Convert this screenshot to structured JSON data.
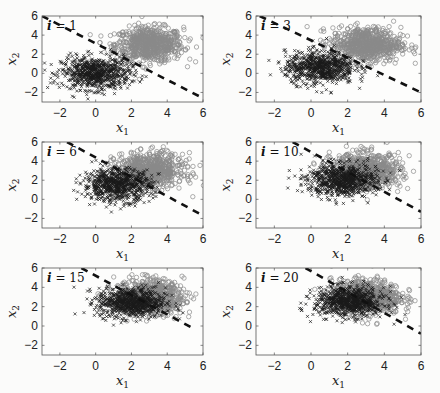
{
  "chart_data": [
    {
      "type": "scatter",
      "panel_label": "i = 1",
      "xlabel": "x_1",
      "ylabel": "x_2",
      "xlim": [
        -3,
        6
      ],
      "ylim": [
        -3,
        6
      ],
      "xticks": [
        -2,
        0,
        2,
        4,
        6
      ],
      "yticks": [
        -2,
        0,
        2,
        4,
        6
      ],
      "series": [
        {
          "name": "class x (black crosses)",
          "marker": "x",
          "color": "#1a1a1a",
          "center": [
            0.0,
            0.0
          ],
          "spread": [
            1.0,
            1.0
          ]
        },
        {
          "name": "class o (gray circles)",
          "marker": "o",
          "color": "#8a8a8a",
          "center": [
            3.0,
            3.0
          ],
          "spread": [
            1.0,
            1.0
          ]
        }
      ],
      "boundary": {
        "style": "dashed",
        "color": "#111111",
        "from": [
          -3,
          6.0
        ],
        "to": [
          6,
          -2.6
        ]
      }
    },
    {
      "type": "scatter",
      "panel_label": "i = 3",
      "xlabel": "x_1",
      "ylabel": "x_2",
      "xlim": [
        -3,
        6
      ],
      "ylim": [
        -3,
        6
      ],
      "xticks": [
        -2,
        0,
        2,
        4,
        6
      ],
      "yticks": [
        -2,
        0,
        2,
        4,
        6
      ],
      "series": [
        {
          "name": "class x (black crosses)",
          "marker": "x",
          "color": "#1a1a1a",
          "center": [
            0.5,
            0.6
          ],
          "spread": [
            1.0,
            1.0
          ]
        },
        {
          "name": "class o (gray circles)",
          "marker": "o",
          "color": "#8a8a8a",
          "center": [
            3.0,
            3.0
          ],
          "spread": [
            1.0,
            1.0
          ]
        }
      ],
      "boundary": {
        "style": "dashed",
        "color": "#111111",
        "from": [
          -2.8,
          6.0
        ],
        "to": [
          6,
          -2.0
        ]
      }
    },
    {
      "type": "scatter",
      "panel_label": "i = 6",
      "xlabel": "x_1",
      "ylabel": "x_2",
      "xlim": [
        -3,
        6
      ],
      "ylim": [
        -3,
        6
      ],
      "xticks": [
        -2,
        0,
        2,
        4,
        6
      ],
      "yticks": [
        -2,
        0,
        2,
        4,
        6
      ],
      "series": [
        {
          "name": "class x (black crosses)",
          "marker": "x",
          "color": "#1a1a1a",
          "center": [
            1.2,
            1.5
          ],
          "spread": [
            1.0,
            1.0
          ]
        },
        {
          "name": "class o (gray circles)",
          "marker": "o",
          "color": "#8a8a8a",
          "center": [
            3.0,
            3.0
          ],
          "spread": [
            1.0,
            1.0
          ]
        }
      ],
      "boundary": {
        "style": "dashed",
        "color": "#111111",
        "from": [
          -1.6,
          6.0
        ],
        "to": [
          6,
          -1.7
        ]
      }
    },
    {
      "type": "scatter",
      "panel_label": "i = 10",
      "xlabel": "x_1",
      "ylabel": "x_2",
      "xlim": [
        -3,
        6
      ],
      "ylim": [
        -3,
        6
      ],
      "xticks": [
        -2,
        0,
        2,
        4,
        6
      ],
      "yticks": [
        -2,
        0,
        2,
        4,
        6
      ],
      "series": [
        {
          "name": "class x (black crosses)",
          "marker": "x",
          "color": "#1a1a1a",
          "center": [
            1.7,
            2.0
          ],
          "spread": [
            1.0,
            1.0
          ]
        },
        {
          "name": "class o (gray circles)",
          "marker": "o",
          "color": "#8a8a8a",
          "center": [
            3.0,
            3.0
          ],
          "spread": [
            1.0,
            1.0
          ]
        }
      ],
      "boundary": {
        "style": "dashed",
        "color": "#111111",
        "from": [
          -1.0,
          6.0
        ],
        "to": [
          6,
          -1.3
        ]
      }
    },
    {
      "type": "scatter",
      "panel_label": "i = 15",
      "xlabel": "x_1",
      "ylabel": "x_2",
      "xlim": [
        -3,
        6
      ],
      "ylim": [
        -3,
        6
      ],
      "xticks": [
        -2,
        0,
        2,
        4,
        6
      ],
      "yticks": [
        -2,
        0,
        2,
        4,
        6
      ],
      "series": [
        {
          "name": "class x (black crosses)",
          "marker": "x",
          "color": "#1a1a1a",
          "center": [
            2.0,
            2.4
          ],
          "spread": [
            1.0,
            0.9
          ]
        },
        {
          "name": "class o (gray circles)",
          "marker": "o",
          "color": "#8a8a8a",
          "center": [
            3.0,
            3.0
          ],
          "spread": [
            1.0,
            1.0
          ]
        }
      ],
      "boundary": {
        "style": "dashed",
        "color": "#111111",
        "from": [
          -0.8,
          6.0
        ],
        "to": [
          5.4,
          -0.2
        ]
      }
    },
    {
      "type": "scatter",
      "panel_label": "i = 20",
      "xlabel": "x_1",
      "ylabel": "x_2",
      "xlim": [
        -3,
        6
      ],
      "ylim": [
        -3,
        6
      ],
      "xticks": [
        -2,
        0,
        2,
        4,
        6
      ],
      "yticks": [
        -2,
        0,
        2,
        4,
        6
      ],
      "series": [
        {
          "name": "class x (black crosses)",
          "marker": "x",
          "color": "#1a1a1a",
          "center": [
            2.1,
            2.5
          ],
          "spread": [
            1.0,
            0.9
          ]
        },
        {
          "name": "class o (gray circles)",
          "marker": "o",
          "color": "#8a8a8a",
          "center": [
            3.0,
            3.0
          ],
          "spread": [
            1.0,
            1.0
          ]
        }
      ],
      "boundary": {
        "style": "dashed",
        "color": "#111111",
        "from": [
          -0.3,
          6.0
        ],
        "to": [
          6,
          -0.8
        ]
      }
    }
  ],
  "labels": {
    "xlabel_base": "x",
    "xlabel_sub": "1",
    "ylabel_base": "x",
    "ylabel_sub": "2"
  }
}
